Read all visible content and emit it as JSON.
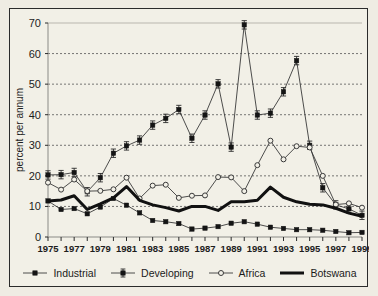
{
  "chart_data": {
    "type": "line",
    "title": "",
    "xlabel": "",
    "ylabel": "percent per annum",
    "ylim": [
      0,
      70
    ],
    "xlim": [
      1975,
      1999
    ],
    "yticks": [
      0,
      10,
      20,
      30,
      40,
      50,
      60,
      70
    ],
    "xticks": [
      1975,
      1976,
      1977,
      1978,
      1979,
      1980,
      1981,
      1982,
      1983,
      1984,
      1985,
      1986,
      1987,
      1988,
      1989,
      1990,
      1991,
      1992,
      1993,
      1994,
      1995,
      1996,
      1997,
      1998,
      1999
    ],
    "xtick_labels": [
      "1975",
      "",
      "1977",
      "",
      "1979",
      "",
      "1981",
      "",
      "1983",
      "",
      "1985",
      "",
      "1987",
      "",
      "1989",
      "",
      "1991",
      "",
      "1993",
      "",
      "1995",
      "",
      "1997",
      "",
      "1999"
    ],
    "grid": "horizontal-dashed",
    "legend_position": "bottom",
    "x": [
      1975,
      1976,
      1977,
      1978,
      1979,
      1980,
      1981,
      1982,
      1983,
      1984,
      1985,
      1986,
      1987,
      1988,
      1989,
      1990,
      1991,
      1992,
      1993,
      1994,
      1995,
      1996,
      1997,
      1998,
      1999
    ],
    "series": [
      {
        "name": "Industrial",
        "marker": "filled-square",
        "values": [
          11.8,
          9.0,
          9.3,
          7.6,
          9.8,
          12.6,
          10.4,
          7.9,
          5.4,
          5.0,
          4.4,
          2.6,
          2.9,
          3.4,
          4.5,
          5.0,
          4.2,
          3.2,
          2.8,
          2.4,
          2.4,
          2.2,
          1.8,
          1.4,
          1.5
        ]
      },
      {
        "name": "Developing",
        "marker": "square-errorbar",
        "values": [
          20.3,
          20.4,
          21.1,
          14.8,
          19.4,
          27.4,
          29.8,
          31.7,
          36.6,
          38.8,
          41.7,
          32.3,
          39.9,
          50.1,
          29.4,
          69.4,
          39.9,
          40.5,
          47.5,
          57.7,
          30.0,
          16.1,
          10.5,
          9.2,
          7.1
        ]
      },
      {
        "name": "Africa",
        "marker": "open-circle",
        "values": [
          17.8,
          15.5,
          18.8,
          15.0,
          15.1,
          15.6,
          19.4,
          12.6,
          16.8,
          17.1,
          12.8,
          13.5,
          13.6,
          19.6,
          19.5,
          15.0,
          23.5,
          31.5,
          25.4,
          29.7,
          29.3,
          20.0,
          10.6,
          11.0,
          9.6
        ]
      },
      {
        "name": "Botswana",
        "marker": "none",
        "values": [
          11.8,
          12.1,
          13.5,
          9.0,
          10.8,
          12.8,
          16.5,
          12.0,
          10.5,
          9.6,
          8.5,
          10.0,
          10.0,
          8.7,
          11.5,
          11.5,
          12.0,
          16.3,
          13.0,
          11.5,
          10.7,
          10.5,
          9.4,
          7.8,
          6.8
        ]
      }
    ]
  },
  "legend": {
    "items": [
      {
        "label": "Industrial",
        "swatch": "line-filled-square"
      },
      {
        "label": "Developing",
        "swatch": "line-square-errorbar"
      },
      {
        "label": "Africa",
        "swatch": "line-open-circle"
      },
      {
        "label": "Botswana",
        "swatch": "thick-line"
      }
    ]
  },
  "colors": {
    "background": "#efece3",
    "plot_background": "#f2f0e7",
    "border": "#2b2b2b",
    "grid": "#555555",
    "series_line": "#3a3a3a",
    "botswana_line": "#111111"
  }
}
